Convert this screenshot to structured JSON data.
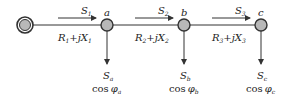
{
  "diagram": {
    "title": "",
    "source": {
      "label": ""
    },
    "nodes": [
      {
        "id": "a",
        "label": "a",
        "load_s": "S",
        "load_s_sub": "a",
        "cos": "cos",
        "phi": "φ",
        "phi_sub": "a"
      },
      {
        "id": "b",
        "label": "b",
        "load_s": "S",
        "load_s_sub": "b",
        "cos": "cos",
        "phi": "φ",
        "phi_sub": "b"
      },
      {
        "id": "c",
        "label": "c",
        "load_s": "S",
        "load_s_sub": "c",
        "cos": "cos",
        "phi": "φ",
        "phi_sub": "c"
      }
    ],
    "lines": [
      {
        "flow": "S",
        "flow_sub": "1",
        "R": "R",
        "R_sub": "1",
        "plus_j": "+j",
        "X": "X",
        "X_sub": "1"
      },
      {
        "flow": "S",
        "flow_sub": "2",
        "R": "R",
        "R_sub": "2",
        "plus_j": "+j",
        "X": "X",
        "X_sub": "2"
      },
      {
        "flow": "S",
        "flow_sub": "3",
        "R": "R",
        "R_sub": "3",
        "plus_j": "+j",
        "X": "X",
        "X_sub": "3"
      }
    ],
    "colors": {
      "node_fill": "#b8b8b8",
      "stroke": "#333333"
    }
  }
}
